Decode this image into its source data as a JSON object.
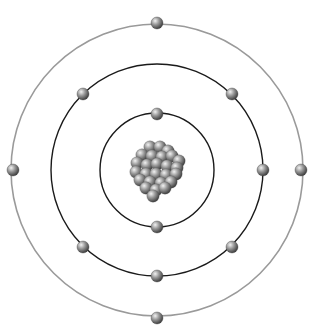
{
  "diagram": {
    "type": "bohr-atom-model",
    "center": [
      157,
      170
    ],
    "colors": {
      "background": "#ffffff",
      "outer_orbit": "#9a9a9a",
      "inner_orbits": "#1a1a1a",
      "particle_light": "#e8e8e8",
      "particle_mid": "#8a8a8a",
      "particle_dark": "#3a3a3a"
    },
    "orbits": [
      {
        "name": "shell-1",
        "radius": 57,
        "electron_count": 2,
        "electrons": [
          [
            157,
            114
          ],
          [
            157,
            227
          ]
        ]
      },
      {
        "name": "shell-2",
        "radius": 106,
        "electron_count": 6,
        "electrons": [
          [
            83,
            94
          ],
          [
            232,
            94
          ],
          [
            263,
            170
          ],
          [
            83,
            247
          ],
          [
            232,
            247
          ],
          [
            157,
            276
          ]
        ]
      },
      {
        "name": "shell-3",
        "radius": 146,
        "electron_count": 4,
        "electrons": [
          [
            157,
            23
          ],
          [
            13,
            170
          ],
          [
            301,
            170
          ],
          [
            157,
            318
          ]
        ]
      }
    ],
    "nucleus": {
      "particles": [
        [
          150,
          147
        ],
        [
          160,
          147
        ],
        [
          168,
          151
        ],
        [
          142,
          155
        ],
        [
          152,
          156
        ],
        [
          162,
          157
        ],
        [
          172,
          156
        ],
        [
          179,
          161
        ],
        [
          137,
          163
        ],
        [
          147,
          165
        ],
        [
          157,
          164
        ],
        [
          167,
          166
        ],
        [
          177,
          168
        ],
        [
          136,
          172
        ],
        [
          146,
          174
        ],
        [
          156,
          174
        ],
        [
          166,
          175
        ],
        [
          176,
          174
        ],
        [
          140,
          180
        ],
        [
          150,
          182
        ],
        [
          161,
          183
        ],
        [
          171,
          182
        ],
        [
          146,
          188
        ],
        [
          156,
          190
        ],
        [
          165,
          188
        ],
        [
          153,
          196
        ]
      ]
    }
  }
}
